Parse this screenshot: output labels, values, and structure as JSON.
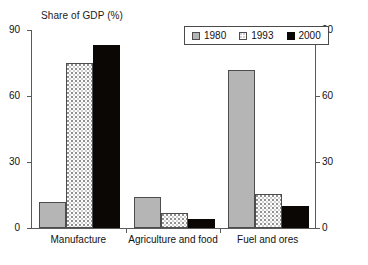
{
  "chart_data": {
    "type": "bar",
    "title": "Share of GDP (%)",
    "xlabel": "",
    "ylabel": "",
    "ylim": [
      0,
      90
    ],
    "yticks": [
      0,
      30,
      60,
      90
    ],
    "y_axis_right": true,
    "yticks_right": [
      0,
      30,
      60,
      90
    ],
    "grid": false,
    "legend_position": "top-center",
    "categories": [
      "Manufacture",
      "Agriculture and food",
      "Fuel and ores"
    ],
    "series": [
      {
        "name": "1980",
        "color": "#b5b5b5",
        "values": [
          12,
          14,
          72
        ]
      },
      {
        "name": "1993",
        "color": "#fdfdfd",
        "values": [
          75,
          7,
          15.5
        ]
      },
      {
        "name": "2000",
        "color": "#0b0705",
        "values": [
          83,
          4,
          10
        ]
      }
    ]
  },
  "axis": {
    "left_ticks": [
      "90",
      "60",
      "30",
      "0"
    ],
    "right_ticks": [
      "90",
      "60",
      "30",
      "0"
    ]
  },
  "legend": {
    "entries": [
      {
        "label": "1980"
      },
      {
        "label": "1993"
      },
      {
        "label": "2000"
      }
    ]
  }
}
